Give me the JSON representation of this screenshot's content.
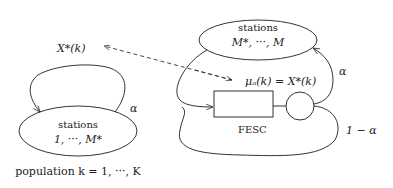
{
  "diagram": {
    "left_node": {
      "line1": "stations",
      "line2": "1, ···, M*"
    },
    "right_node": {
      "line1": "stations",
      "line2": "M*, ···, M"
    },
    "labels": {
      "x_star": "X*(k)",
      "mu": "μₐ(k) = X*(k)",
      "alpha_left": "α",
      "alpha_right": "α",
      "one_minus_alpha": "1 − α",
      "fesc": "FESC",
      "population": "population k = 1, ···, K"
    },
    "colors": {
      "stroke": "#333333",
      "text": "#222222"
    }
  }
}
